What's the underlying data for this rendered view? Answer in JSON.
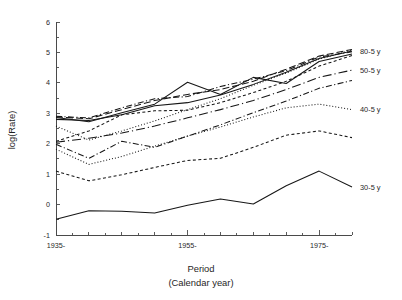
{
  "chart_data": {
    "type": "line",
    "title": "",
    "xlabel": "Period",
    "xlabel_sub": "(Calendar year)",
    "ylabel": "log(Rate)",
    "xlim": [
      1935,
      1980
    ],
    "ylim": [
      -1,
      6
    ],
    "ytick_labels": [
      "6",
      "5",
      "4",
      "3",
      "2",
      "1",
      "0",
      "-1"
    ],
    "ytick_values": [
      6,
      5,
      4,
      3,
      2,
      1,
      0,
      -1
    ],
    "xtick_labels": [
      "1935-",
      "1955-",
      "1975-"
    ],
    "xtick_values": [
      1935,
      1955,
      1975
    ],
    "xtick_minor_values": [
      1940,
      1945,
      1950,
      1960,
      1965,
      1970,
      1980
    ],
    "grid": false,
    "legend_position": "right",
    "x": [
      1935,
      1940,
      1945,
      1950,
      1955,
      1960,
      1965,
      1970,
      1975,
      1980
    ],
    "series": [
      {
        "name": "80-5 y",
        "label": "80-5 y",
        "legend": true,
        "dash": "solid",
        "values": [
          2.8,
          2.76,
          2.95,
          3.25,
          3.35,
          3.6,
          3.95,
          4.35,
          4.8,
          5.05
        ]
      },
      {
        "name": "75-5 y",
        "label": "",
        "legend": false,
        "dash": "dashed-long",
        "values": [
          2.88,
          2.82,
          3.12,
          3.42,
          3.62,
          3.78,
          4.05,
          4.45,
          4.88,
          5.1
        ]
      },
      {
        "name": "70-5 y",
        "label": "",
        "legend": false,
        "dash": "dash-dot",
        "values": [
          2.9,
          2.85,
          3.18,
          3.48,
          3.55,
          3.88,
          4.12,
          4.4,
          4.85,
          5.02
        ]
      },
      {
        "name": "65-5 y",
        "label": "",
        "legend": false,
        "dash": "solid",
        "values": [
          2.86,
          2.72,
          3.02,
          3.3,
          4.02,
          3.62,
          4.18,
          3.98,
          4.7,
          4.95
        ]
      },
      {
        "name": "60-5 y",
        "label": "",
        "legend": false,
        "dash": "dotted",
        "values": [
          2.58,
          2.12,
          2.42,
          2.75,
          3.12,
          3.48,
          3.92,
          4.32,
          4.78,
          5.08
        ]
      },
      {
        "name": "55-5 y",
        "label": "",
        "legend": false,
        "dash": "dashed-short",
        "values": [
          2.08,
          2.42,
          2.95,
          3.08,
          3.1,
          3.35,
          3.68,
          4.05,
          4.55,
          4.9
        ]
      },
      {
        "name": "50-5 y",
        "label": "50-5 y",
        "legend": true,
        "dash": "dash-dot-long",
        "values": [
          2.05,
          2.18,
          2.35,
          2.58,
          2.85,
          3.12,
          3.42,
          3.78,
          4.18,
          4.42
        ]
      },
      {
        "name": "45-5 y",
        "label": "",
        "legend": false,
        "dash": "dash-dot",
        "values": [
          1.98,
          1.52,
          2.08,
          1.88,
          2.25,
          2.62,
          3.02,
          3.4,
          3.82,
          4.08
        ]
      },
      {
        "name": "40-5 y",
        "label": "40-5 y",
        "legend": true,
        "dash": "dotted",
        "values": [
          1.82,
          1.32,
          1.58,
          1.92,
          2.25,
          2.55,
          2.88,
          3.18,
          3.3,
          3.12
        ]
      },
      {
        "name": "35-5 y",
        "label": "",
        "legend": false,
        "dash": "dashed-short",
        "values": [
          1.1,
          0.78,
          0.98,
          1.22,
          1.45,
          1.52,
          1.88,
          2.28,
          2.42,
          2.2
        ]
      },
      {
        "name": "30-5 y",
        "label": "30-5 y",
        "legend": true,
        "dash": "solid",
        "values": [
          -0.48,
          -0.2,
          -0.22,
          -0.28,
          -0.02,
          0.18,
          0.02,
          0.62,
          1.1,
          0.58
        ]
      }
    ],
    "legend_entries": [
      {
        "label": "80-5 y"
      },
      {
        "label": "50-5 y"
      },
      {
        "label": "40-5 y"
      },
      {
        "label": "30-5 y"
      }
    ]
  }
}
